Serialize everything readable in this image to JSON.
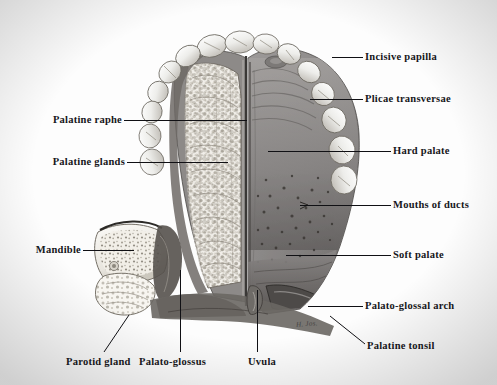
{
  "plate": {
    "title": "Palate and oral cavity roof",
    "signature": "H. Jos.",
    "background_color": "#fdfdfd",
    "ink_color": "#16161a"
  },
  "labels": [
    {
      "id": "incisive-papilla",
      "text": "Incisive papilla",
      "side": "right",
      "x": 365,
      "y": 51,
      "leader": {
        "x1": 332,
        "y1": 57,
        "x2": 363,
        "y2": 57
      }
    },
    {
      "id": "plicae-transversae",
      "text": "Plicae transversae",
      "side": "right",
      "x": 365,
      "y": 93,
      "leader": {
        "x1": 310,
        "y1": 99,
        "x2": 363,
        "y2": 99
      }
    },
    {
      "id": "hard-palate",
      "text": "Hard palate",
      "side": "right",
      "x": 393,
      "y": 145,
      "leader": {
        "x1": 268,
        "y1": 151,
        "x2": 391,
        "y2": 151
      }
    },
    {
      "id": "mouths-of-ducts",
      "text": "Mouths of ducts",
      "side": "right",
      "x": 393,
      "y": 199,
      "leader": {
        "x1": 300,
        "y1": 205,
        "x2": 391,
        "y2": 205
      }
    },
    {
      "id": "soft-palate",
      "text": "Soft palate",
      "side": "right",
      "x": 393,
      "y": 249,
      "leader": {
        "x1": 286,
        "y1": 255,
        "x2": 391,
        "y2": 255
      }
    },
    {
      "id": "palato-glossal-arch",
      "text": "Palato-glossal arch",
      "side": "right",
      "x": 365,
      "y": 300,
      "leader": {
        "x1": 308,
        "y1": 306,
        "x2": 363,
        "y2": 306
      }
    },
    {
      "id": "palatine-tonsil",
      "text": "Palatine tonsil",
      "side": "right",
      "x": 367,
      "y": 340,
      "leader": {
        "x1": 330,
        "y1": 316,
        "x2": 365,
        "y2": 344
      }
    },
    {
      "id": "palatine-raphe",
      "text": "Palatine raphe",
      "side": "left",
      "x": 122,
      "y": 114,
      "leader": {
        "x1": 124,
        "y1": 120,
        "x2": 247,
        "y2": 120
      }
    },
    {
      "id": "palatine-glands",
      "text": "Palatine glands",
      "side": "left",
      "x": 125,
      "y": 156,
      "leader": {
        "x1": 127,
        "y1": 162,
        "x2": 228,
        "y2": 162
      }
    },
    {
      "id": "mandible",
      "text": "Mandible",
      "side": "left",
      "x": 81,
      "y": 244,
      "leader": {
        "x1": 83,
        "y1": 250,
        "x2": 134,
        "y2": 250
      }
    },
    {
      "id": "parotid-gland",
      "text": "Parotid gland",
      "side": "bottom",
      "x": 66,
      "y": 356,
      "leader": {
        "x1": 129,
        "y1": 315,
        "x2": 104,
        "y2": 352
      }
    },
    {
      "id": "palato-glossus",
      "text": "Palato-glossus",
      "side": "bottom",
      "x": 139,
      "y": 356,
      "leader": {
        "x1": 180,
        "y1": 270,
        "x2": 180,
        "y2": 352
      }
    },
    {
      "id": "uvula",
      "text": "Uvula",
      "side": "bottom",
      "x": 248,
      "y": 356,
      "leader": {
        "x1": 257,
        "y1": 290,
        "x2": 257,
        "y2": 352
      }
    }
  ],
  "regions": [
    {
      "id": "teeth-arch",
      "name": "Upper dental arch",
      "description": "Maxillary teeth forming the arch border"
    },
    {
      "id": "dissected-half",
      "name": "Dissected left half",
      "description": "Mucosa reflected exposing palatine glands"
    },
    {
      "id": "intact-half",
      "name": "Intact right half",
      "description": "Smooth mucosa of hard and soft palate"
    },
    {
      "id": "mandible-section",
      "name": "Mandible cross-section",
      "description": "Cut ramus showing trabecular bone"
    },
    {
      "id": "parotid-section",
      "name": "Parotid gland cross-section",
      "description": "Sectioned gland lobules"
    },
    {
      "id": "uvula-region",
      "name": "Uvula and tonsillar fossa",
      "description": "Soft palate free margin with uvula"
    }
  ]
}
